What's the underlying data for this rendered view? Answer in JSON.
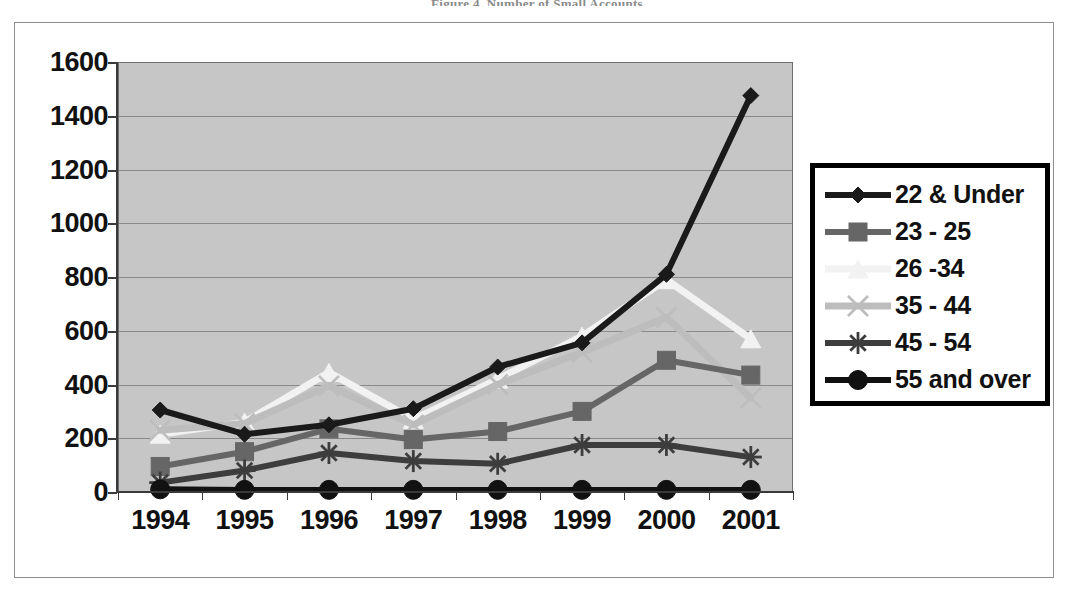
{
  "document": {
    "faint_title": "Figure 4.  Number of Small Accounts"
  },
  "legend": {
    "position": "right",
    "entries": [
      {
        "label": "22 & Under",
        "marker": "diamond",
        "color": "#1a1a1a"
      },
      {
        "label": "23 - 25",
        "marker": "square",
        "color": "#666666"
      },
      {
        "label": "26 -34",
        "marker": "triangle",
        "color": "#f2f2f2"
      },
      {
        "label": "35 - 44",
        "marker": "x",
        "color": "#bdbdbd"
      },
      {
        "label": "45 - 54",
        "marker": "star",
        "color": "#3d3d3d"
      },
      {
        "label": "55 and over",
        "marker": "circle",
        "color": "#111111"
      }
    ]
  },
  "chart_data": {
    "type": "line",
    "title": "",
    "xlabel": "",
    "ylabel": "",
    "categories": [
      "1994",
      "1995",
      "1996",
      "1997",
      "1998",
      "1999",
      "2000",
      "2001"
    ],
    "ylim": [
      0,
      1600
    ],
    "ytick_step": 200,
    "yticks": [
      0,
      200,
      400,
      600,
      800,
      1000,
      1200,
      1400,
      1600
    ],
    "grid": true,
    "plot_background": "#c6c6c6",
    "series": [
      {
        "name": "22 & Under",
        "color": "#1a1a1a",
        "marker": "diamond",
        "values": [
          305,
          215,
          250,
          310,
          465,
          555,
          810,
          1475
        ]
      },
      {
        "name": "23 - 25",
        "color": "#666666",
        "marker": "square",
        "values": [
          95,
          150,
          235,
          195,
          225,
          300,
          490,
          435
        ]
      },
      {
        "name": "26 -34",
        "color": "#f2f2f2",
        "marker": "triangle",
        "values": [
          215,
          260,
          445,
          270,
          420,
          580,
          790,
          570
        ]
      },
      {
        "name": "35 - 44",
        "color": "#bdbdbd",
        "marker": "x",
        "values": [
          230,
          255,
          395,
          250,
          400,
          520,
          650,
          350
        ]
      },
      {
        "name": "45 - 54",
        "color": "#3d3d3d",
        "marker": "star",
        "values": [
          35,
          80,
          145,
          115,
          105,
          175,
          175,
          130
        ]
      },
      {
        "name": "55 and over",
        "color": "#111111",
        "marker": "circle",
        "values": [
          10,
          8,
          8,
          8,
          8,
          8,
          8,
          8
        ]
      }
    ]
  }
}
